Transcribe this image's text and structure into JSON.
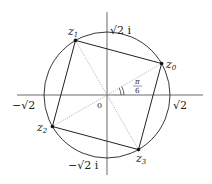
{
  "diagram": {
    "origin_label": "0",
    "axis_labels": {
      "pos_real": "√2",
      "neg_real": "−√2",
      "pos_imag": "√2 i",
      "neg_imag": "−√2 i"
    },
    "angle_label": {
      "numerator": "π",
      "denominator": "6"
    },
    "points": [
      {
        "label": "z",
        "sub": "0",
        "angle_deg": 30
      },
      {
        "label": "z",
        "sub": "1",
        "angle_deg": 120
      },
      {
        "label": "z",
        "sub": "2",
        "angle_deg": 210
      },
      {
        "label": "z",
        "sub": "3",
        "angle_deg": 300
      }
    ],
    "colors": {
      "stroke": "#222222",
      "dotted": "#888888",
      "background": "#ffffff"
    }
  }
}
